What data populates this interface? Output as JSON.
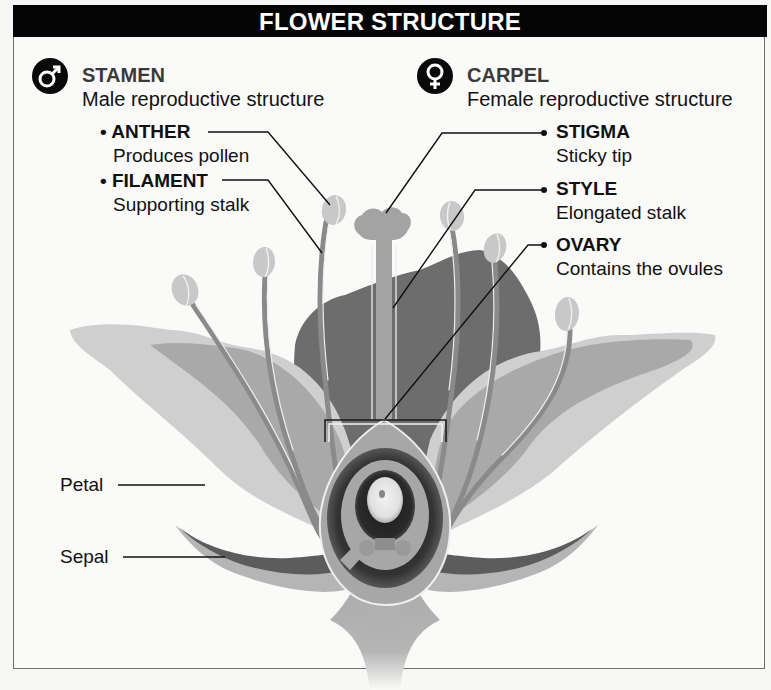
{
  "title": "FLOWER STRUCTURE",
  "stamen": {
    "icon": "male-symbol-icon",
    "title": "STAMEN",
    "subtitle": "Male reproductive structure",
    "parts": [
      {
        "bullet": "•",
        "name": "ANTHER",
        "description": "Produces pollen"
      },
      {
        "bullet": "•",
        "name": "FILAMENT",
        "description": "Supporting stalk"
      }
    ]
  },
  "carpel": {
    "icon": "female-symbol-icon",
    "title": "CARPEL",
    "subtitle": "Female reproductive structure",
    "parts": [
      {
        "bullet": "•",
        "name": "STIGMA",
        "description": "Sticky tip"
      },
      {
        "bullet": "•",
        "name": "STYLE",
        "description": "Elongated stalk"
      },
      {
        "bullet": "•",
        "name": "OVARY",
        "description": "Contains the ovules"
      }
    ]
  },
  "other_labels": {
    "petal": "Petal",
    "sepal": "Sepal"
  },
  "colors": {
    "title_bar": "#050505",
    "background": "#fafaf8",
    "petal_outer_light": "#c9c9c9",
    "petal_mid": "#a9a9a9",
    "petal_dark_back": "#6d6d6d",
    "sepal": "#5c5c5c",
    "ovary_dark": "#3a3a3a",
    "stamen_anther": "#c8c8c8",
    "filament": "#8a8a8a"
  }
}
